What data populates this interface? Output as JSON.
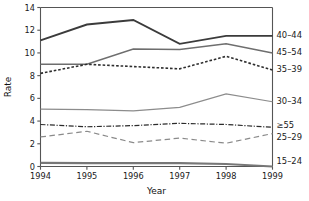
{
  "chart_data": {
    "type": "line",
    "title": "",
    "xlabel": "Year",
    "ylabel": "Rate",
    "categories": [
      "1994",
      "1995",
      "1996",
      "1997",
      "1998",
      "1999"
    ],
    "x": [
      1994,
      1995,
      1996,
      1997,
      1998,
      1999
    ],
    "xlim": [
      1994,
      1999
    ],
    "ylim": [
      0,
      14
    ],
    "y_ticks": [
      0,
      2,
      4,
      6,
      8,
      10,
      12,
      14
    ],
    "y_tick_labels": [
      "0",
      "2",
      "4",
      "6",
      "8",
      "10",
      "12",
      "14"
    ],
    "x_ticks": [
      1994,
      1995,
      1996,
      1997,
      1998,
      1999
    ],
    "x_tick_labels": [
      "1994",
      "1995",
      "1996",
      "1997",
      "1998",
      "1999"
    ],
    "grid": false,
    "legend_position": "right-inline-end-of-line",
    "series": [
      {
        "name": "40-44",
        "label": "40–44",
        "values": [
          11.1,
          12.5,
          12.9,
          10.8,
          11.5,
          11.5
        ],
        "color": "#3b3b3b",
        "width": 1.9,
        "dash": "none"
      },
      {
        "name": "45-54",
        "label": "45–54",
        "values": [
          9.0,
          9.0,
          10.35,
          10.3,
          10.8,
          10.0
        ],
        "color": "#6e6e6e",
        "width": 1.5,
        "dash": "none"
      },
      {
        "name": "35-39",
        "label": "35–39",
        "values": [
          8.2,
          9.0,
          8.8,
          8.6,
          9.7,
          8.5
        ],
        "color": "#2e2e2e",
        "width": 1.6,
        "dash": "2.6,1.9"
      },
      {
        "name": "30-34",
        "label": "30–34",
        "values": [
          5.05,
          5.0,
          4.9,
          5.2,
          6.4,
          5.7
        ],
        "color": "#8c8c8c",
        "width": 1.2,
        "dash": "none"
      },
      {
        "name": ">=55",
        "label": "≥55",
        "values": [
          3.7,
          3.5,
          3.6,
          3.8,
          3.7,
          3.45
        ],
        "color": "#2b2b2b",
        "width": 1.2,
        "dash": "5,1.6,1.2,1.6"
      },
      {
        "name": "25-29",
        "label": "25–29",
        "values": [
          2.6,
          3.1,
          2.1,
          2.5,
          2.05,
          2.9
        ],
        "color": "#8a8a8a",
        "width": 1.2,
        "dash": "5.5,3.5"
      },
      {
        "name": "15-24",
        "label": "15–24",
        "values": [
          0.32,
          0.3,
          0.3,
          0.3,
          0.22,
          0.0
        ],
        "color": "#777777",
        "width": 2.1,
        "dash": "none"
      }
    ],
    "series_label_y": {
      "40-44": 11.5,
      "45-54": 10.0,
      "35-39": 8.5,
      "30-34": 5.7,
      ">=55": 3.6,
      "25-29": 2.55,
      "15-24": 0.45
    }
  }
}
